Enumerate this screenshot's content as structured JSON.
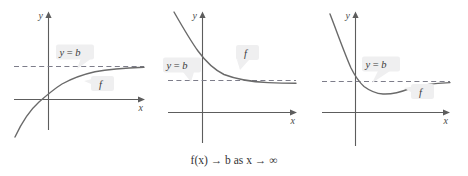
{
  "figure": {
    "caption": "f(x) → b as x → ∞",
    "background_color": "#ffffff",
    "curve_color": "#6a6a6a",
    "axis_color": "#5d5d5d",
    "asymptote_color": "#7d7d8a",
    "callout_fill": "#efeff0"
  },
  "panels": [
    {
      "id": "panel-left",
      "axis_x_label": "x",
      "axis_y_label": "y",
      "asymptote_label": "y = b",
      "function_label": "f",
      "description": "increasing curve approaching y = b from below"
    },
    {
      "id": "panel-middle",
      "axis_x_label": "x",
      "axis_y_label": "y",
      "asymptote_label": "y = b",
      "function_label": "f",
      "description": "decreasing curve approaching y = b from above"
    },
    {
      "id": "panel-right",
      "axis_x_label": "x",
      "axis_y_label": "y",
      "asymptote_label": "y = b",
      "function_label": "f",
      "description": "curve crosses y = b, dips to a local minimum, then rises to approach y = b from below"
    }
  ],
  "chart_data": {
    "type": "line",
    "title": "",
    "subtitle": "",
    "xlabel": "x",
    "ylabel": "y",
    "annotation": "f(x) → b as x → ∞",
    "grid": false,
    "legend": "none",
    "panel_count": 3,
    "shared": {
      "asymptote_value_label": "b",
      "asymptote_style": "dashed",
      "series_label": "f"
    },
    "panels": [
      {
        "name": "approach from below",
        "asymptote_y": 1.0,
        "xlim": [
          -1.2,
          6.0
        ],
        "ylim": [
          -2.6,
          2.2
        ],
        "series": [
          {
            "name": "f",
            "x": [
              -1.2,
              -0.9,
              -0.6,
              -0.3,
              0.0,
              0.4,
              0.8,
              1.2,
              1.8,
              2.4,
              3.2,
              4.0,
              5.0,
              6.0
            ],
            "y": [
              -2.55,
              -1.62,
              -0.92,
              -0.38,
              0.0,
              0.38,
              0.61,
              0.75,
              0.87,
              0.93,
              0.97,
              0.985,
              0.995,
              1.0
            ]
          }
        ]
      },
      {
        "name": "approach from above",
        "asymptote_y": 0.35,
        "xlim": [
          -1.6,
          6.0
        ],
        "ylim": [
          -1.4,
          3.0
        ],
        "series": [
          {
            "name": "f",
            "x": [
              -1.6,
              -1.2,
              -0.8,
              -0.4,
              0.0,
              0.4,
              0.9,
              1.5,
              2.2,
              3.0,
              4.0,
              5.0,
              6.0
            ],
            "y": [
              2.95,
              2.42,
              1.85,
              1.3,
              0.95,
              0.73,
              0.58,
              0.48,
              0.42,
              0.39,
              0.37,
              0.36,
              0.355
            ]
          }
        ]
      },
      {
        "name": "crosses then approaches from below",
        "asymptote_y": 0.6,
        "xlim": [
          -1.3,
          6.0
        ],
        "ylim": [
          -1.8,
          2.8
        ],
        "series": [
          {
            "name": "f",
            "x": [
              -1.3,
              -1.0,
              -0.7,
              -0.35,
              0.0,
              0.35,
              0.8,
              1.3,
              1.9,
              2.5,
              3.2,
              4.0,
              4.8,
              6.0
            ],
            "y": [
              2.75,
              2.15,
              1.55,
              1.02,
              0.6,
              0.3,
              0.08,
              0.0,
              0.05,
              0.2,
              0.4,
              0.52,
              0.57,
              0.59
            ]
          }
        ]
      }
    ]
  }
}
